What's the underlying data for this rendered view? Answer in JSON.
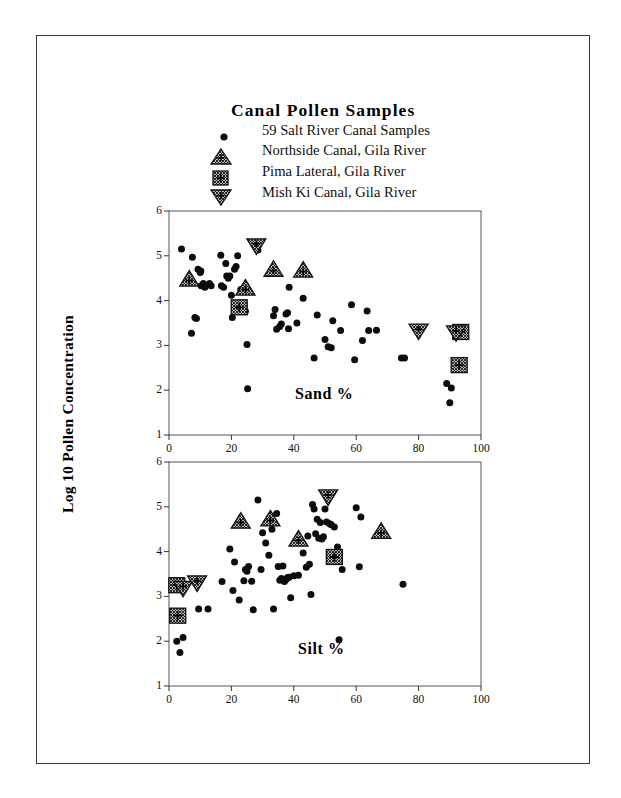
{
  "page": {
    "width": 621,
    "height": 798,
    "background": "#ffffff",
    "border_color": "#3a3a3a"
  },
  "figure": {
    "title": "Canal Pollen Samples",
    "y_axis_title": "Log 10 Pollen Concentration",
    "legend": [
      {
        "marker": "filled-circle-icon",
        "label": "59 Salt River Canal Samples"
      },
      {
        "marker": "hatched-up-triangle-icon",
        "label": "Northside Canal, Gila River"
      },
      {
        "marker": "hatched-square-icon",
        "label": "Pima Lateral, Gila River"
      },
      {
        "marker": "hatched-down-triangle-icon",
        "label": "Mish Ki Canal, Gila River"
      }
    ]
  },
  "chart_data": [
    {
      "type": "scatter",
      "panel": "top",
      "title": "Canal Pollen Samples",
      "annotation": "Sand %",
      "xlabel": "",
      "ylabel": "Log 10 Pollen Concentration",
      "xlim": [
        0,
        100
      ],
      "ylim": [
        1,
        6
      ],
      "xticks": [
        0,
        20,
        40,
        60,
        80,
        100
      ],
      "yticks": [
        1,
        2,
        3,
        4,
        5,
        6
      ],
      "grid": false,
      "legend_position": "above-plot",
      "series": [
        {
          "name": "59 Salt River Canal Samples",
          "marker": "filled-circle-icon",
          "points": [
            [
              4.0,
              5.15
            ],
            [
              7.5,
              4.97
            ],
            [
              7.2,
              3.27
            ],
            [
              8.3,
              3.62
            ],
            [
              8.8,
              3.6
            ],
            [
              9.3,
              4.7
            ],
            [
              10.0,
              4.63
            ],
            [
              10.2,
              4.66
            ],
            [
              10.3,
              4.33
            ],
            [
              11.0,
              4.38
            ],
            [
              11.5,
              4.3
            ],
            [
              13.0,
              4.38
            ],
            [
              13.5,
              4.33
            ],
            [
              16.6,
              5.01
            ],
            [
              16.8,
              4.33
            ],
            [
              17.5,
              4.3
            ],
            [
              18.2,
              4.83
            ],
            [
              18.5,
              4.55
            ],
            [
              19.0,
              4.5
            ],
            [
              19.5,
              4.55
            ],
            [
              20.0,
              4.12
            ],
            [
              20.3,
              3.62
            ],
            [
              21.0,
              4.7
            ],
            [
              21.5,
              4.76
            ],
            [
              22.0,
              5.0
            ],
            [
              24.5,
              3.76
            ],
            [
              25.0,
              3.02
            ],
            [
              25.2,
              2.03
            ],
            [
              28.5,
              5.13
            ],
            [
              33.5,
              3.66
            ],
            [
              34.0,
              3.8
            ],
            [
              34.5,
              3.36
            ],
            [
              35.5,
              3.42
            ],
            [
              36.0,
              3.48
            ],
            [
              37.5,
              3.7
            ],
            [
              38.0,
              3.73
            ],
            [
              38.3,
              3.37
            ],
            [
              38.5,
              4.3
            ],
            [
              41.0,
              3.5
            ],
            [
              43.0,
              4.05
            ],
            [
              46.5,
              2.72
            ],
            [
              47.5,
              3.68
            ],
            [
              50.0,
              3.13
            ],
            [
              51.0,
              2.97
            ],
            [
              52.0,
              2.95
            ],
            [
              52.5,
              3.55
            ],
            [
              55.0,
              3.33
            ],
            [
              58.5,
              3.91
            ],
            [
              59.5,
              2.68
            ],
            [
              62.0,
              3.11
            ],
            [
              63.5,
              3.77
            ],
            [
              64.0,
              3.33
            ],
            [
              66.5,
              3.34
            ],
            [
              74.5,
              2.72
            ],
            [
              75.5,
              2.72
            ],
            [
              89.0,
              2.15
            ],
            [
              90.5,
              2.05
            ],
            [
              90.0,
              1.72
            ],
            [
              23.0,
              4.25
            ]
          ]
        },
        {
          "name": "Northside Canal, Gila River",
          "marker": "hatched-up-triangle-icon",
          "points": [
            [
              6.5,
              4.48
            ],
            [
              24.5,
              4.28
            ],
            [
              33.5,
              4.7
            ],
            [
              43.0,
              4.68
            ]
          ]
        },
        {
          "name": "Pima Lateral, Gila River",
          "marker": "hatched-square-icon",
          "points": [
            [
              22.5,
              3.85
            ],
            [
              93.5,
              3.3
            ],
            [
              93.0,
              2.56
            ]
          ]
        },
        {
          "name": "Mish Ki Canal, Gila River",
          "marker": "hatched-down-triangle-icon",
          "points": [
            [
              28.0,
              5.22
            ],
            [
              80.0,
              3.32
            ],
            [
              92.0,
              3.28
            ]
          ]
        }
      ]
    },
    {
      "type": "scatter",
      "panel": "bottom",
      "annotation": "Silt %",
      "xlabel": "",
      "ylabel": "Log 10 Pollen Concentration",
      "xlim": [
        0,
        100
      ],
      "ylim": [
        1,
        6
      ],
      "xticks": [
        0,
        20,
        40,
        60,
        80,
        100
      ],
      "yticks": [
        1,
        2,
        3,
        4,
        5,
        6
      ],
      "grid": false,
      "series": [
        {
          "name": "59 Salt River Canal Samples",
          "marker": "filled-circle-icon",
          "points": [
            [
              2.5,
              2.0
            ],
            [
              3.5,
              1.75
            ],
            [
              4.5,
              2.08
            ],
            [
              9.5,
              2.72
            ],
            [
              12.5,
              2.72
            ],
            [
              17.0,
              3.33
            ],
            [
              19.5,
              4.06
            ],
            [
              20.5,
              3.13
            ],
            [
              21.0,
              3.77
            ],
            [
              22.5,
              2.92
            ],
            [
              24.0,
              3.35
            ],
            [
              24.5,
              3.6
            ],
            [
              25.0,
              3.56
            ],
            [
              25.5,
              3.67
            ],
            [
              26.5,
              3.34
            ],
            [
              27.0,
              2.7
            ],
            [
              28.5,
              5.15
            ],
            [
              29.5,
              3.6
            ],
            [
              30.0,
              4.42
            ],
            [
              31.0,
              4.19
            ],
            [
              32.0,
              3.92
            ],
            [
              33.0,
              4.5
            ],
            [
              33.5,
              2.72
            ],
            [
              34.5,
              4.85
            ],
            [
              35.0,
              3.67
            ],
            [
              35.5,
              3.36
            ],
            [
              36.0,
              3.4
            ],
            [
              36.5,
              3.68
            ],
            [
              37.0,
              3.33
            ],
            [
              37.5,
              3.38
            ],
            [
              38.0,
              3.42
            ],
            [
              38.5,
              3.43
            ],
            [
              39.0,
              2.97
            ],
            [
              40.0,
              3.46
            ],
            [
              41.5,
              3.47
            ],
            [
              43.0,
              3.97
            ],
            [
              44.0,
              3.65
            ],
            [
              44.5,
              4.35
            ],
            [
              45.0,
              3.72
            ],
            [
              45.5,
              3.04
            ],
            [
              46.0,
              5.05
            ],
            [
              46.5,
              4.95
            ],
            [
              47.0,
              4.4
            ],
            [
              47.5,
              4.72
            ],
            [
              48.0,
              4.3
            ],
            [
              48.5,
              4.65
            ],
            [
              49.0,
              4.28
            ],
            [
              49.5,
              4.33
            ],
            [
              50.0,
              4.95
            ],
            [
              50.5,
              4.66
            ],
            [
              51.5,
              4.62
            ],
            [
              52.0,
              4.6
            ],
            [
              53.0,
              4.55
            ],
            [
              54.0,
              4.1
            ],
            [
              54.5,
              2.03
            ],
            [
              55.5,
              3.6
            ],
            [
              60.0,
              4.98
            ],
            [
              61.0,
              3.66
            ],
            [
              61.5,
              4.77
            ],
            [
              75.0,
              3.27
            ]
          ]
        },
        {
          "name": "Northside Canal, Gila River",
          "marker": "hatched-up-triangle-icon",
          "points": [
            [
              23.0,
              4.68
            ],
            [
              32.5,
              4.73
            ],
            [
              41.5,
              4.28
            ],
            [
              68.0,
              4.45
            ]
          ]
        },
        {
          "name": "Pima Lateral, Gila River",
          "marker": "hatched-square-icon",
          "points": [
            [
              2.5,
              3.25
            ],
            [
              2.8,
              2.57
            ],
            [
              53.0,
              3.88
            ]
          ]
        },
        {
          "name": "Mish Ki Canal, Gila River",
          "marker": "hatched-down-triangle-icon",
          "points": [
            [
              4.5,
              3.18
            ],
            [
              9.0,
              3.3
            ],
            [
              51.0,
              5.22
            ]
          ]
        }
      ]
    }
  ]
}
